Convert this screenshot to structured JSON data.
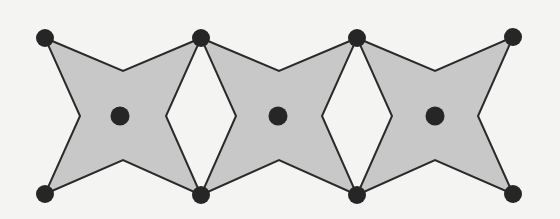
{
  "diagram": {
    "colors": {
      "background": "#f4f4f2",
      "fill": "#c8c8c8",
      "stroke": "#2a2a2a",
      "dot": "#262626"
    },
    "dot_radius": 9,
    "center_dot_radius": 9.5,
    "stars": [
      {
        "id": "star-1",
        "tips": [
          [
            45,
            38
          ],
          [
            201,
            38
          ],
          [
            201,
            195
          ],
          [
            45,
            194
          ]
        ],
        "inner": {
          "top": [
            123,
            71
          ],
          "right": [
            166,
            116
          ],
          "bottom": [
            123,
            160
          ],
          "left": [
            80,
            116
          ]
        },
        "center": [
          120,
          116
        ]
      },
      {
        "id": "star-2",
        "tips": [
          [
            201,
            38
          ],
          [
            357,
            38
          ],
          [
            357,
            195
          ],
          [
            201,
            195
          ]
        ],
        "inner": {
          "top": [
            279,
            71
          ],
          "right": [
            322,
            116
          ],
          "bottom": [
            279,
            160
          ],
          "left": [
            236,
            116
          ]
        },
        "center": [
          278,
          116
        ]
      },
      {
        "id": "star-3",
        "tips": [
          [
            357,
            38
          ],
          [
            513,
            37
          ],
          [
            513,
            194
          ],
          [
            357,
            195
          ]
        ],
        "inner": {
          "top": [
            435,
            71
          ],
          "right": [
            478,
            116
          ],
          "bottom": [
            435,
            160
          ],
          "left": [
            392,
            116
          ]
        },
        "center": [
          435,
          116
        ]
      }
    ],
    "vertices": [
      [
        45,
        38
      ],
      [
        201,
        38
      ],
      [
        357,
        38
      ],
      [
        513,
        37
      ],
      [
        45,
        194
      ],
      [
        201,
        195
      ],
      [
        357,
        195
      ],
      [
        513,
        194
      ]
    ]
  }
}
